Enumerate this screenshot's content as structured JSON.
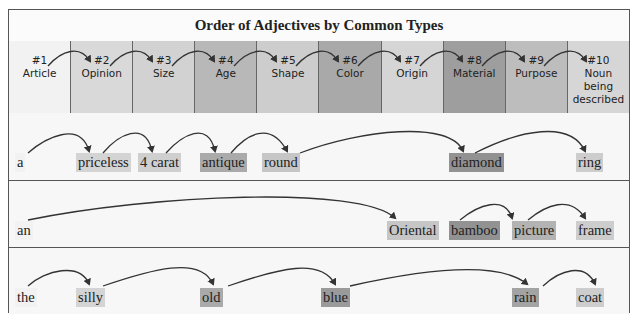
{
  "title": "Order of Adjectives by Common Types",
  "columns": [
    {
      "num": "#1",
      "label": "Article",
      "color": "#f2f2f2"
    },
    {
      "num": "#2",
      "label": "Opinion",
      "color": "#d9d9d9"
    },
    {
      "num": "#3",
      "label": "Size",
      "color": "#d2d2d2"
    },
    {
      "num": "#4",
      "label": "Age",
      "color": "#b8b8b8"
    },
    {
      "num": "#5",
      "label": "Shape",
      "color": "#cdcdcd"
    },
    {
      "num": "#6",
      "label": "Color",
      "color": "#a9a9a9"
    },
    {
      "num": "#7",
      "label": "Origin",
      "color": "#d5d5d5"
    },
    {
      "num": "#8",
      "label": "Material",
      "color": "#9e9e9e"
    },
    {
      "num": "#9",
      "label": "Purpose",
      "color": "#bdbdbd"
    },
    {
      "num": "#10",
      "label": "Noun being described",
      "color": "#d6d6d6"
    }
  ],
  "examples": [
    {
      "words": [
        {
          "text": "a",
          "col": 1
        },
        {
          "text": "priceless",
          "col": 2
        },
        {
          "text": "4 carat",
          "col": 3
        },
        {
          "text": "antique",
          "col": 4
        },
        {
          "text": "round",
          "col": 5
        },
        {
          "text": "diamond",
          "col": 8
        },
        {
          "text": "ring",
          "col": 10
        }
      ]
    },
    {
      "words": [
        {
          "text": "an",
          "col": 1
        },
        {
          "text": "Oriental",
          "col": 7
        },
        {
          "text": "bamboo",
          "col": 8
        },
        {
          "text": "picture",
          "col": 9
        },
        {
          "text": "frame",
          "col": 10
        }
      ]
    },
    {
      "words": [
        {
          "text": "the",
          "col": 1
        },
        {
          "text": "silly",
          "col": 2
        },
        {
          "text": "old",
          "col": 4
        },
        {
          "text": "blue",
          "col": 6
        },
        {
          "text": "rain",
          "col": 9
        },
        {
          "text": "coat",
          "col": 10
        }
      ]
    }
  ]
}
